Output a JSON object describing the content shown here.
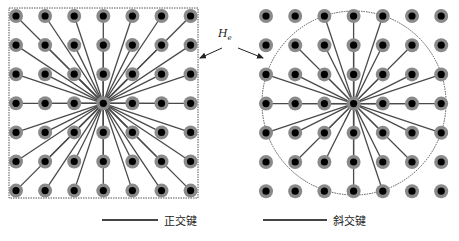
{
  "figure": {
    "label_h": "H",
    "label_h_sub": "e",
    "legend": [
      {
        "label": "正交键",
        "color": "#444444"
      },
      {
        "label": "斜交键",
        "color": "#444444"
      }
    ],
    "colors": {
      "atom_outer": "#8a8a8a",
      "atom_inner": "#000000",
      "bond": "#4a4a4a",
      "boundary": "#555555"
    },
    "left_panel": {
      "shape": "square",
      "grid": {
        "cols": 7,
        "rows": 7,
        "x0": 16,
        "y0": 16,
        "spacing": 29.1
      },
      "center": {
        "col": 3,
        "row": 3
      },
      "box": {
        "x": 9,
        "y": 8,
        "w": 189,
        "h": 190
      }
    },
    "right_panel": {
      "shape": "circle",
      "grid": {
        "cols": 7,
        "rows": 7,
        "x0": 266,
        "y0": 16,
        "spacing": 29.2
      },
      "center": {
        "col": 3,
        "row": 3
      },
      "circle": {
        "cx": 354,
        "cy": 103,
        "r": 92
      }
    }
  }
}
